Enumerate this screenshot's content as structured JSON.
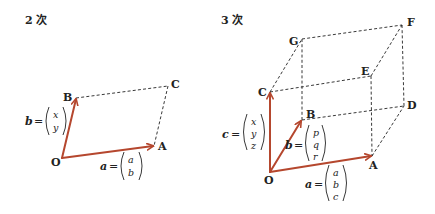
{
  "colors": {
    "vector": "#b5472e",
    "ink": "#222222",
    "background": "#ffffff"
  },
  "panels": [
    {
      "title": "2 次",
      "points": {
        "O": "O",
        "A": "A",
        "B": "B",
        "C": "C"
      },
      "vectors": [
        {
          "name": "a",
          "label": "a",
          "components": [
            "a",
            "b"
          ],
          "from": "O",
          "to": "A"
        },
        {
          "name": "b",
          "label": "b",
          "components": [
            "x",
            "y"
          ],
          "from": "O",
          "to": "B"
        }
      ],
      "dashed_edges": [
        [
          "B",
          "C"
        ],
        [
          "C",
          "A"
        ]
      ]
    },
    {
      "title": "3 次",
      "points": {
        "O": "O",
        "A": "A",
        "B": "B",
        "C": "C",
        "D": "D",
        "E": "E",
        "F": "F",
        "G": "G"
      },
      "vectors": [
        {
          "name": "a",
          "label": "a",
          "components": [
            "a",
            "b",
            "c"
          ],
          "from": "O",
          "to": "A"
        },
        {
          "name": "b",
          "label": "b",
          "components": [
            "p",
            "q",
            "r"
          ],
          "from": "O",
          "to": "B"
        },
        {
          "name": "c",
          "label": "c",
          "components": [
            "x",
            "y",
            "z"
          ],
          "from": "O",
          "to": "C"
        }
      ],
      "dashed_edges": [
        [
          "A",
          "D"
        ],
        [
          "B",
          "D"
        ],
        [
          "C",
          "E"
        ],
        [
          "A",
          "E"
        ],
        [
          "B",
          "G"
        ],
        [
          "C",
          "G"
        ],
        [
          "G",
          "F"
        ],
        [
          "E",
          "F"
        ],
        [
          "D",
          "F"
        ]
      ]
    }
  ],
  "equals": "="
}
